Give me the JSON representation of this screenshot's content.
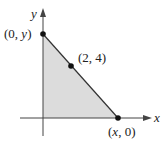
{
  "diagram": {
    "type": "coordinate-region",
    "axes": {
      "x_label": "x",
      "y_label": "y"
    },
    "points": [
      {
        "id": "y-intercept",
        "label_open": "(0, ",
        "label_var": "y",
        "label_close": ")"
      },
      {
        "id": "given-point",
        "label": "(2, 4)"
      },
      {
        "id": "x-intercept",
        "label_open": "(",
        "label_var": "x",
        "label_close": ", 0)"
      }
    ],
    "region": {
      "description": "Shaded right triangle bounded by the axes and the line through (0, y), (2, 4), (x, 0)"
    },
    "colors": {
      "fill": "#dcdcdc",
      "line": "#333333",
      "axis": "#444444",
      "point": "#111111"
    }
  }
}
